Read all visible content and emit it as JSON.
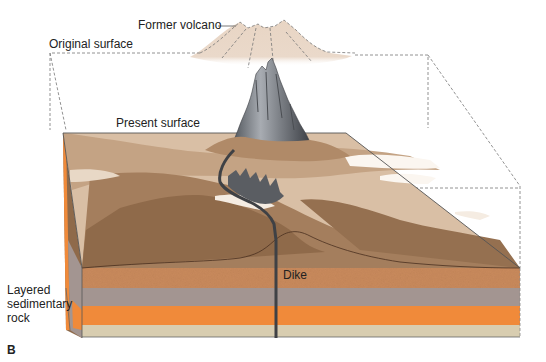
{
  "figure": {
    "panel_label": "B",
    "labels": {
      "former_volcano": "Former volcano",
      "original_surface": "Original surface",
      "present_surface": "Present surface",
      "dike": "Dike",
      "layered_rock_line1": "Layered",
      "layered_rock_line2": "sedimentary",
      "layered_rock_line3": "rock"
    },
    "colors": {
      "former_volcano_fill": "#e8d5c4",
      "neck_rock": "#8a8d92",
      "upper_land": "#c9ab8e",
      "lower_land": "#8f6a4a",
      "sandstone": "#c98a5c",
      "gray_layer": "#a39591",
      "orange_layer": "#f08a3a",
      "tan_layer": "#d8cdb0",
      "dike": "#3f4145",
      "dashed_outline": "#777777"
    }
  }
}
